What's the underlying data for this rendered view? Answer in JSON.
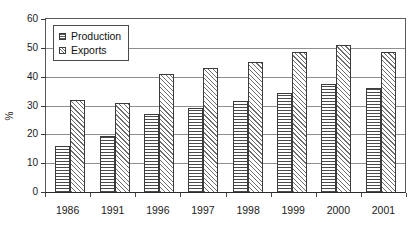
{
  "chart_data": {
    "type": "bar",
    "title": "",
    "xlabel": "",
    "ylabel": "%",
    "ylim": [
      0,
      60
    ],
    "yticks": [
      0,
      10,
      20,
      30,
      40,
      50,
      60
    ],
    "ytick_labels": [
      "0",
      "10",
      "20",
      "30",
      "40",
      "50",
      "60"
    ],
    "grid": "horizontal",
    "legend_position": "top-left-inside",
    "categories": [
      "1986",
      "1991",
      "1996",
      "1997",
      "1998",
      "1999",
      "2000",
      "2001"
    ],
    "series": [
      {
        "name": "Production",
        "pattern": "horizontal-hatch",
        "values": [
          16,
          19.5,
          27,
          29,
          31.5,
          34.5,
          37.5,
          36
        ]
      },
      {
        "name": "Exports",
        "pattern": "diagonal-hatch",
        "values": [
          32,
          31,
          41,
          43,
          45,
          48.5,
          51,
          48.5
        ]
      }
    ]
  },
  "legend": {
    "items": [
      {
        "label": "Production",
        "swatch": "production-swatch-icon"
      },
      {
        "label": "Exports",
        "swatch": "exports-swatch-icon"
      }
    ]
  },
  "colors": {
    "axis": "#2b2b2b",
    "gridline": "#8e8e8e",
    "bar_outline": "#3b3b3b",
    "background": "#ffffff",
    "text": "#1a1a1a"
  }
}
